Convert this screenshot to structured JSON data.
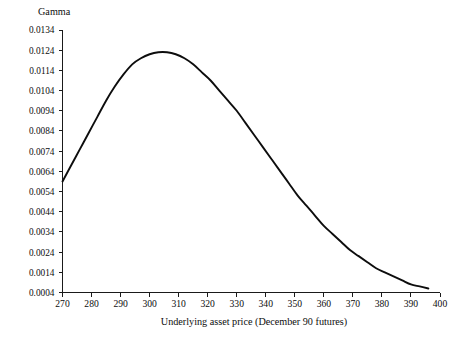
{
  "chart_data": {
    "type": "line",
    "title": "",
    "xlabel": "Underlying asset price (December 90 futures)",
    "ylabel": "Gamma",
    "xlim": [
      270,
      400
    ],
    "ylim": [
      0.0004,
      0.0134
    ],
    "grid": false,
    "legend": null,
    "x_ticks": [
      270,
      280,
      290,
      300,
      310,
      320,
      330,
      340,
      350,
      360,
      370,
      380,
      390,
      400
    ],
    "x_tick_labels": [
      "270",
      "280",
      "290",
      "300",
      "310",
      "320",
      "330",
      "340",
      "350",
      "360",
      "370",
      "380",
      "390",
      "400"
    ],
    "y_ticks": [
      0.0004,
      0.0014,
      0.0024,
      0.0034,
      0.0044,
      0.0054,
      0.0064,
      0.0074,
      0.0084,
      0.0094,
      0.0104,
      0.0114,
      0.0124,
      0.0134
    ],
    "y_tick_labels": [
      "0.0004",
      "0.0014",
      "0.0024",
      "0.0034",
      "0.0044",
      "0.0054",
      "0.0064",
      "0.0074",
      "0.0084",
      "0.0094",
      "0.0104",
      "0.0114",
      "0.0124",
      "0.0134"
    ],
    "series": [
      {
        "name": "Gamma",
        "color": "#0d0d0d",
        "x": [
          270,
          273,
          276,
          279,
          282,
          285,
          288,
          291,
          294,
          297,
          300,
          303,
          306,
          309,
          312,
          315,
          318,
          321,
          324,
          327,
          330,
          333,
          336,
          339,
          342,
          345,
          348,
          351,
          354,
          357,
          360,
          363,
          366,
          369,
          372,
          375,
          378,
          381,
          384,
          387,
          390,
          393,
          396
        ],
        "y": [
          0.0059,
          0.0067,
          0.0075,
          0.0083,
          0.0091,
          0.0099,
          0.0106,
          0.0112,
          0.0117,
          0.012,
          0.0122,
          0.0123,
          0.0123,
          0.0122,
          0.012,
          0.0117,
          0.0113,
          0.0109,
          0.0104,
          0.0099,
          0.0094,
          0.0088,
          0.0082,
          0.0076,
          0.007,
          0.0064,
          0.0058,
          0.0052,
          0.0047,
          0.0042,
          0.0037,
          0.0033,
          0.0029,
          0.0025,
          0.0022,
          0.0019,
          0.0016,
          0.0014,
          0.0012,
          0.001,
          0.0008,
          0.0007,
          0.0006
        ]
      }
    ],
    "peak": {
      "x": 305,
      "y": 0.0123
    }
  },
  "axes": {
    "y_title": "Gamma",
    "x_title": "Underlying asset price (December 90 futures)"
  },
  "colors": {
    "curve": "#0d0d0d",
    "axis": "#1a1a1a",
    "background": "#ffffff"
  }
}
